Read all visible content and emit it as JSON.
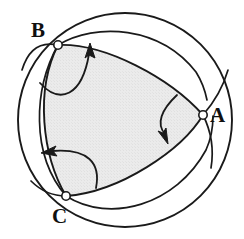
{
  "figure": {
    "kind": "spherical-triangle-diagram",
    "caption_text": "",
    "canvas": {
      "width": 244,
      "height": 239
    },
    "colors": {
      "stroke": "#1a1a1a",
      "fill_interior": "#e9e9e9",
      "background": "#ffffff",
      "vertex_marker_fill": "#ffffff"
    },
    "sphere": {
      "name": "outer-sphere-outline",
      "center_x": 125,
      "center_y": 120,
      "radius": 107,
      "stroke_width": 1.9
    },
    "vertices": [
      {
        "id": "A",
        "label": "A",
        "x": 203,
        "y": 115,
        "marker_radius": 4.2,
        "label_x": 210,
        "label_y": 105
      },
      {
        "id": "B",
        "label": "B",
        "x": 58,
        "y": 45,
        "marker_radius": 4.2,
        "label_x": 31,
        "label_y": 20
      },
      {
        "id": "C",
        "label": "C",
        "x": 66,
        "y": 196,
        "marker_radius": 4.2,
        "label_x": 52,
        "label_y": 206
      }
    ],
    "arcs": [
      {
        "id": "arc-BA-front",
        "from": "B",
        "to": "A",
        "note": "upper front edge of shaded triangle"
      },
      {
        "id": "arc-AC-front",
        "from": "A",
        "to": "C",
        "note": "lower right front edge of shaded triangle"
      },
      {
        "id": "arc-CB-front",
        "from": "C",
        "to": "B",
        "note": "left front edge of shaded triangle"
      },
      {
        "id": "arc-BA-back",
        "from": "B",
        "to": "A",
        "note": "great circle continuing behind sphere past B and A"
      },
      {
        "id": "arc-AC-back",
        "from": "A",
        "to": "C",
        "note": "great circle continuing behind sphere past A and C"
      },
      {
        "id": "arc-CB-back",
        "from": "C",
        "to": "B",
        "note": "great circle continuing behind sphere past C and B"
      }
    ],
    "arrows": [
      {
        "id": "arrow-near-B",
        "direction": "up-right",
        "tip_x": 90,
        "tip_y": 44,
        "tail_x": 42,
        "tail_y": 82
      },
      {
        "id": "arrow-near-A",
        "direction": "down-left",
        "tip_x": 166,
        "tip_y": 141,
        "tail_x": 176,
        "tail_y": 96
      },
      {
        "id": "arrow-near-C",
        "direction": "left",
        "tip_x": 43,
        "tip_y": 152,
        "tail_x": 95,
        "tail_y": 186
      }
    ]
  }
}
